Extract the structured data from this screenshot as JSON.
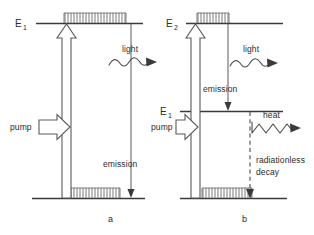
{
  "figure": {
    "background_color": "#ffffff",
    "line_color": "#3a3a3a",
    "width": 314,
    "height": 235
  },
  "panels": [
    {
      "id": "a",
      "caption": "a",
      "levels": [
        {
          "name": "upper-level",
          "label": "E",
          "subscript": "1",
          "hatched": true
        },
        {
          "name": "ground-level",
          "label": "",
          "subscript": "",
          "hatched": true
        }
      ],
      "annotations": [
        {
          "name": "pump-label",
          "text": "pump"
        },
        {
          "name": "light-label",
          "text": "light"
        },
        {
          "name": "emission-label",
          "text": "emission"
        }
      ]
    },
    {
      "id": "b",
      "caption": "b",
      "levels": [
        {
          "name": "upper-level",
          "label": "E",
          "subscript": "2",
          "hatched": true
        },
        {
          "name": "intermediate-level",
          "label": "E",
          "subscript": "1",
          "hatched": false
        },
        {
          "name": "ground-level",
          "label": "",
          "subscript": "",
          "hatched": true
        }
      ],
      "annotations": [
        {
          "name": "pump-label",
          "text": "pump"
        },
        {
          "name": "light-label",
          "text": "light"
        },
        {
          "name": "emission-label",
          "text": "emission"
        },
        {
          "name": "heat-label",
          "text": "heat"
        },
        {
          "name": "radiationless-decay-label-line1",
          "text": "radiationless"
        },
        {
          "name": "radiationless-decay-label-line2",
          "text": "decay"
        }
      ]
    }
  ]
}
